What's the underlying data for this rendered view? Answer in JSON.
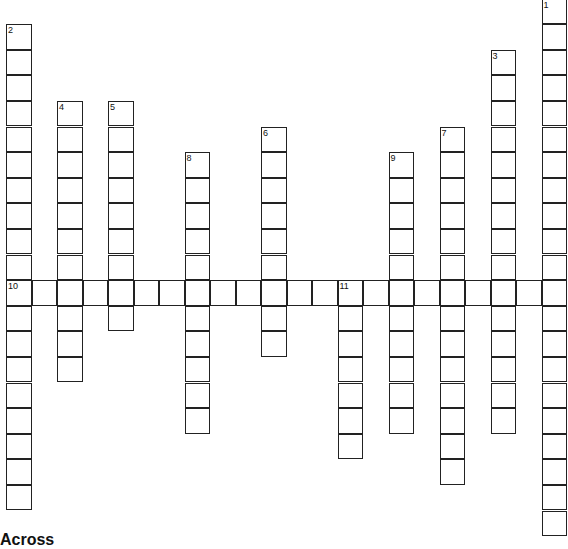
{
  "puzzle": {
    "cell_size": 25.5,
    "origin_x": 6,
    "origin_y": -1.5,
    "row_step": 25.6,
    "words": [
      {
        "number": "1",
        "direction": "down",
        "col": 21,
        "row": 0,
        "length": 21
      },
      {
        "number": "2",
        "direction": "down",
        "col": 0,
        "row": 1,
        "length": 19
      },
      {
        "number": "3",
        "direction": "down",
        "col": 19,
        "row": 2,
        "length": 15
      },
      {
        "number": "4",
        "direction": "down",
        "col": 2,
        "row": 4,
        "length": 11
      },
      {
        "number": "5",
        "direction": "down",
        "col": 4,
        "row": 4,
        "length": 9
      },
      {
        "number": "6",
        "direction": "down",
        "col": 10,
        "row": 5,
        "length": 9
      },
      {
        "number": "7",
        "direction": "down",
        "col": 17,
        "row": 5,
        "length": 14
      },
      {
        "number": "8",
        "direction": "down",
        "col": 7,
        "row": 6,
        "length": 11
      },
      {
        "number": "9",
        "direction": "down",
        "col": 15,
        "row": 6,
        "length": 11
      },
      {
        "number": "10",
        "direction": "across",
        "col": 0,
        "row": 11,
        "length": 22
      },
      {
        "number": "11",
        "direction": "down",
        "col": 13,
        "row": 11,
        "length": 7
      }
    ]
  },
  "clues": {
    "across_heading": "Across"
  }
}
